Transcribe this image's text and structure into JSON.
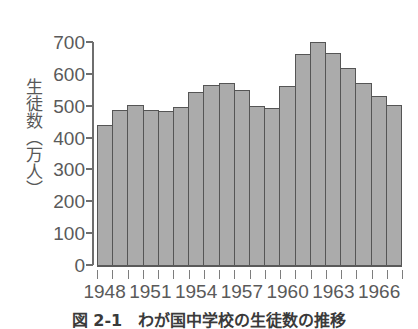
{
  "chart_data": {
    "type": "bar",
    "title": "",
    "subtitle": "",
    "xlabel": "",
    "ylabel": "生徒数（万人）",
    "ylim": [
      0,
      700
    ],
    "yticks": [
      0,
      100,
      200,
      300,
      400,
      500,
      600,
      700
    ],
    "ytick_labels": [
      "0",
      "100",
      "200",
      "300",
      "400",
      "500",
      "600",
      "700"
    ],
    "grid": false,
    "legend": null,
    "bar_color": "#ababab",
    "bar_edge_color": "#555555",
    "axis_color": "#6e6e6e",
    "categories": [
      "1948",
      "1949",
      "1950",
      "1951",
      "1952",
      "1953",
      "1954",
      "1955",
      "1956",
      "1957",
      "1958",
      "1959",
      "1960",
      "1961",
      "1962",
      "1963",
      "1964",
      "1965",
      "1966",
      "1967"
    ],
    "values": [
      440,
      487,
      503,
      487,
      484,
      496,
      543,
      565,
      572,
      548,
      498,
      494,
      563,
      661,
      700,
      665,
      620,
      570,
      531,
      503
    ],
    "xtick_labels": [
      "1948",
      "1951",
      "1954",
      "1957",
      "1960",
      "1963",
      "1966"
    ],
    "xtick_categories": [
      "1948",
      "1951",
      "1954",
      "1957",
      "1960",
      "1963",
      "1966"
    ],
    "xtick_count": 20
  },
  "caption": {
    "text": "図 2-1　わが国中学校の生徒数の推移"
  }
}
